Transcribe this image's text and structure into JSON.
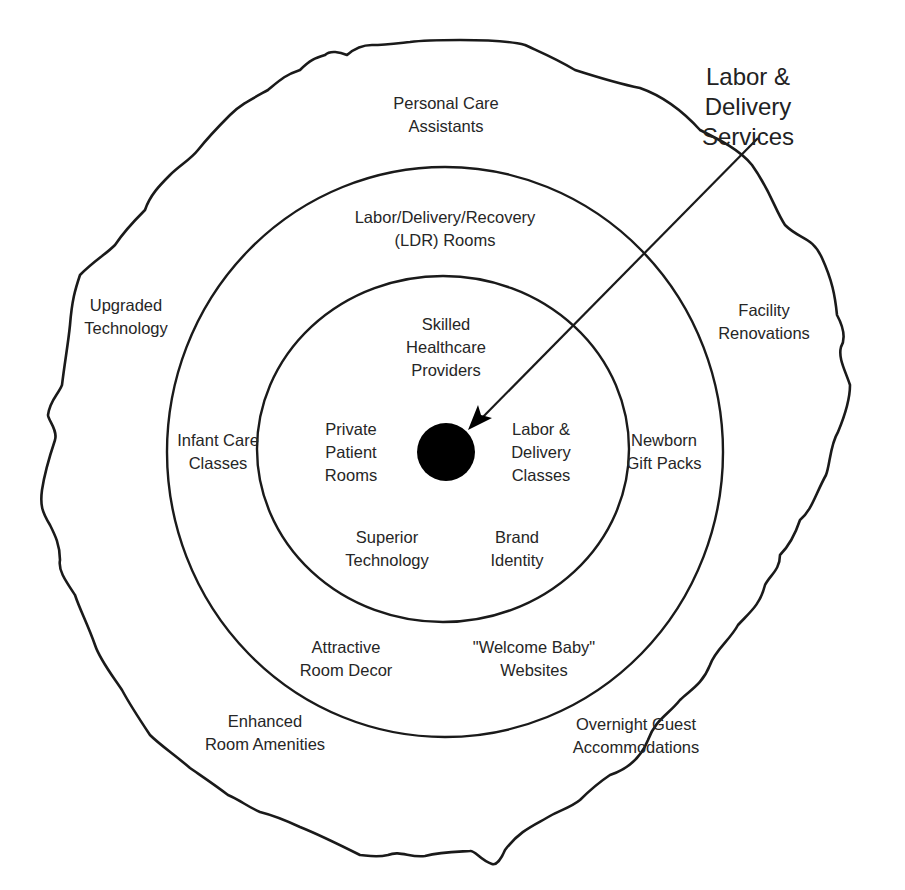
{
  "diagram": {
    "title": "Labor & Delivery Services",
    "callout": {
      "text": "Labor & Delivery\nServices",
      "points_to": "core-benefit-dot"
    },
    "core": {
      "label": "",
      "shape": "filled-circle",
      "color": "#000000"
    },
    "rings": [
      {
        "level": "core-product",
        "items": [
          "Skilled\nHealthcare\nProviders",
          "Private\nPatient\nRooms",
          "Labor &\nDelivery\nClasses",
          "Superior\nTechnology",
          "Brand\nIdentity"
        ]
      },
      {
        "level": "actual-product",
        "items": [
          "Labor/Delivery/Recovery\n(LDR) Rooms",
          "Infant Care\nClasses",
          "Newborn\nGift Packs",
          "Attractive\nRoom Decor",
          "\"Welcome Baby\"\nWebsites"
        ]
      },
      {
        "level": "augmented-product",
        "items": [
          "Personal Care\nAssistants",
          "Upgraded\nTechnology",
          "Facility\nRenovations",
          "Enhanced\nRoom Amenities",
          "Overnight Guest\nAccommodations"
        ]
      }
    ],
    "colors": {
      "stroke": "#1a1a1a",
      "background": "#ffffff",
      "dot": "#000000"
    }
  }
}
